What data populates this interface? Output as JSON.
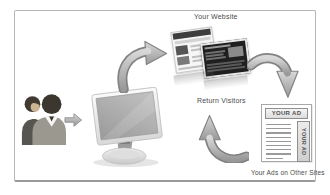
{
  "diagram": {
    "labels": {
      "your_website": "Your Website",
      "return_visitors": "Return Visitors",
      "your_ads_on_other_sites": "Your Ads on Other Sites"
    },
    "ad_page": {
      "top_banner_text": "YOUR AD",
      "side_banner_text": "YOUR AD",
      "text_line_count": 9
    },
    "icons": [
      "visitors-people-icon",
      "right-arrow-icon",
      "computer-monitor-icon",
      "curved-arrow-upright-icon",
      "website-thumbnail-back",
      "website-thumbnail-front",
      "curved-arrow-down-icon",
      "curved-arrow-up-icon"
    ],
    "colors": {
      "background": "#ffffff",
      "frame_border": "#b5b5b5",
      "arrow_fill_light": "#d8d8d8",
      "arrow_fill_dark": "#999999",
      "arrow_outline": "#828282",
      "label_text": "#4a4a4a",
      "ad_banner_border": "#8f8f8f",
      "ad_text_line": "#9a9a9a"
    }
  }
}
